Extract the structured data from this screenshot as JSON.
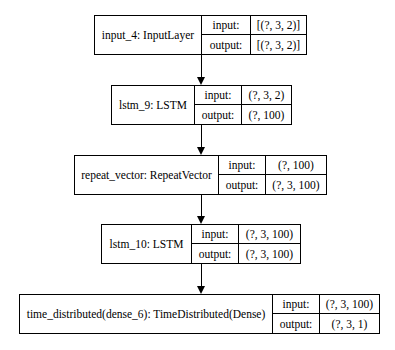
{
  "diagram": {
    "type": "keras-model-plot",
    "nodes": [
      {
        "name": "input_4: InputLayer",
        "input_label": "input:",
        "input_value": "[(?, 3, 2)]",
        "output_label": "output:",
        "output_value": "[(?, 3, 2)]"
      },
      {
        "name": "lstm_9: LSTM",
        "input_label": "input:",
        "input_value": "(?, 3, 2)",
        "output_label": "output:",
        "output_value": "(?, 100)"
      },
      {
        "name": "repeat_vector: RepeatVector",
        "input_label": "input:",
        "input_value": "(?, 100)",
        "output_label": "output:",
        "output_value": "(?, 3, 100)"
      },
      {
        "name": "lstm_10: LSTM",
        "input_label": "input:",
        "input_value": "(?, 3, 100)",
        "output_label": "output:",
        "output_value": "(?, 3, 100)"
      },
      {
        "name": "time_distributed(dense_6): TimeDistributed(Dense)",
        "input_label": "input:",
        "input_value": "(?, 3, 100)",
        "output_label": "output:",
        "output_value": "(?, 3, 1)"
      }
    ],
    "edges": [
      {
        "from": 0,
        "to": 1
      },
      {
        "from": 1,
        "to": 2
      },
      {
        "from": 2,
        "to": 3
      },
      {
        "from": 3,
        "to": 4
      }
    ]
  }
}
